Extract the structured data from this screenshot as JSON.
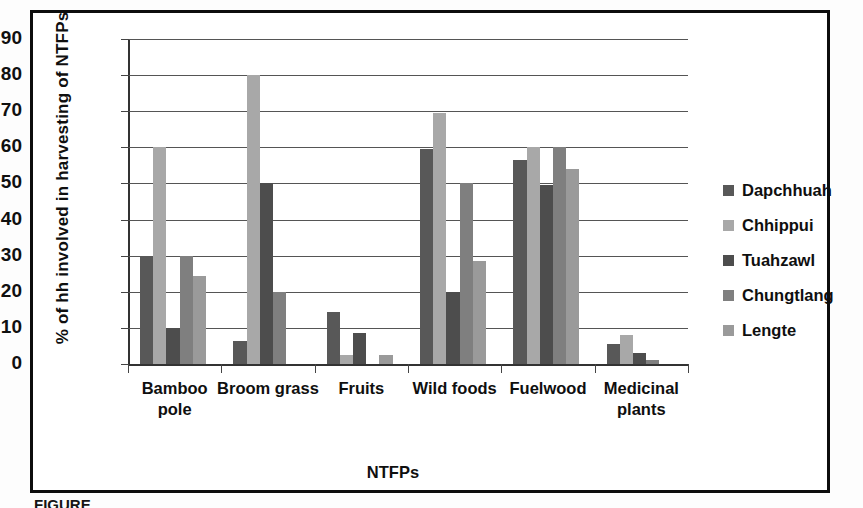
{
  "chart_data": {
    "type": "bar",
    "title": "",
    "xlabel": "NTFPs",
    "ylabel": "% of hh involved in  harvesting of NTFPs",
    "ylim": [
      0,
      90
    ],
    "ytick_step": 10,
    "yticks": [
      90,
      80,
      70,
      60,
      50,
      40,
      30,
      20,
      10,
      0
    ],
    "grid": true,
    "legend_position": "right",
    "categories": [
      "Bamboo pole",
      "Broom grass",
      "Fruits",
      "Wild foods",
      "Fuelwood",
      "Medicinal plants"
    ],
    "category_lines": [
      [
        "Bamboo",
        "pole"
      ],
      [
        "Broom grass"
      ],
      [
        "Fruits"
      ],
      [
        "Wild foods"
      ],
      [
        "Fuelwood"
      ],
      [
        "Medicinal",
        "plants"
      ]
    ],
    "series": [
      {
        "name": "Dapchhuah",
        "color": "#585858",
        "values": [
          30.0,
          6.5,
          14.5,
          59.5,
          56.5,
          5.5
        ]
      },
      {
        "name": "Chhippui",
        "color": "#a8a8a8",
        "values": [
          60.0,
          80.0,
          2.5,
          69.5,
          60.0,
          8.0
        ]
      },
      {
        "name": "Tuahzawl",
        "color": "#4d4d4d",
        "values": [
          10.0,
          50.0,
          8.5,
          20.0,
          49.5,
          3.0
        ]
      },
      {
        "name": "Chungtlang",
        "color": "#7f7f7f",
        "values": [
          30.0,
          20.0,
          0.0,
          50.0,
          60.0,
          1.2
        ]
      },
      {
        "name": "Lengte",
        "color": "#9a9a9a",
        "values": [
          24.5,
          0.0,
          2.5,
          28.5,
          54.0,
          0.0
        ]
      }
    ]
  },
  "caption": {
    "text": "FIGURE"
  },
  "icons": {
    "legend_swatch": "square-swatch-icon"
  }
}
